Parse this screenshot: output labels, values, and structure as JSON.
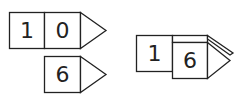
{
  "blocks": {
    "top_left": {
      "digits": [
        "1",
        "0"
      ]
    },
    "bottom_left": {
      "digits": [
        "6"
      ]
    },
    "right_combined": {
      "digits": [
        "1",
        "6"
      ]
    }
  },
  "colors": {
    "stroke": "#222222",
    "fill": "#ffffff"
  }
}
